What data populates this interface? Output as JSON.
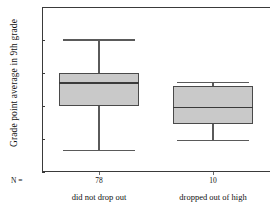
{
  "chart_data": {
    "type": "box",
    "title": "",
    "ylabel": "Grade point average in 9th grade",
    "xlabel": "",
    "ylim": [
      0.0,
      5.0
    ],
    "yticks": [
      "0.0",
      "1.0",
      "2.0",
      "3.0",
      "4.0",
      "5.0"
    ],
    "ytick_values": [
      0.0,
      1.0,
      2.0,
      3.0,
      4.0,
      5.0
    ],
    "grid": false,
    "legend": "none",
    "n_prefix": "N =",
    "categories": [
      "did not drop out",
      "dropped out of high"
    ],
    "counts": [
      "78",
      "10"
    ],
    "boxes": [
      {
        "category": "did not drop out",
        "n": 78,
        "whisker_low": 0.65,
        "q1": 2.0,
        "median": 2.7,
        "q3": 3.0,
        "whisker_high": 4.0
      },
      {
        "category": "dropped out of high",
        "n": 10,
        "whisker_low": 0.95,
        "q1": 1.45,
        "median": 1.95,
        "q3": 2.6,
        "whisker_high": 2.7
      }
    ],
    "colors": {
      "box_fill": "#c9c9c9",
      "box_edge": "#4a4a4a",
      "median": "#3a3a3a",
      "whisker": "#5a5a5a",
      "axis": "#3a3a3a",
      "background": "#ffffff"
    }
  }
}
